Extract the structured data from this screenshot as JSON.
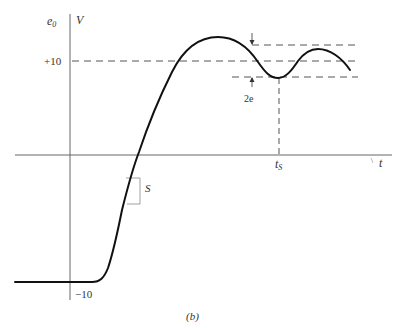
{
  "figure": {
    "caption": "(b)",
    "y_axis": {
      "label": "e",
      "label_sub": "0",
      "unit": "V"
    },
    "x_axis": {
      "label": "t"
    },
    "y_ticks": {
      "upper": "+10",
      "lower": "−10"
    },
    "annotations": {
      "slope": "S",
      "band": "2e",
      "settling_time": "t",
      "settling_time_sub": "S"
    },
    "colors": {
      "curve": "#111111",
      "axis": "#555555",
      "dash": "#555555"
    }
  }
}
